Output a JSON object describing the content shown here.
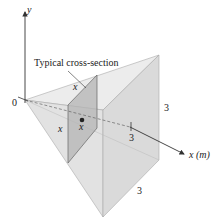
{
  "figure": {
    "y_axis_label": "y",
    "x_axis_label": "x (m)",
    "origin_label": "0",
    "callout": "Typical cross-section",
    "cross_section_side_top": "x",
    "cross_section_side_left": "x",
    "centroid_label": "x",
    "tick_label": "3",
    "height_label": "3",
    "depth_label": "3"
  },
  "colors": {
    "solid_fill": "#e4e4e4",
    "solid_dark": "#d4d4d4",
    "section_fill": "#b8b8b8",
    "edge": "#9a9a9a",
    "axis": "#333333"
  }
}
